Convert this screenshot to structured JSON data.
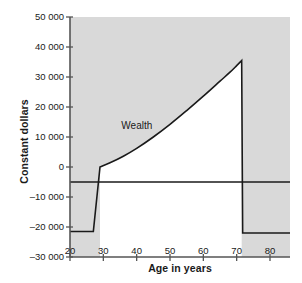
{
  "chart_data": {
    "type": "line",
    "title": "",
    "subtitle": "",
    "xlabel": "Age in years",
    "ylabel": "Constant dollars",
    "xlim": [
      20,
      86
    ],
    "ylim": [
      -30000,
      50000
    ],
    "grid": false,
    "legend_position": "none",
    "plot_background": "#d9d9d9",
    "series_color": "#1a1a1a",
    "xticks": [
      20,
      30,
      40,
      50,
      60,
      70,
      80
    ],
    "xtick_labels": [
      "20",
      "30",
      "40",
      "50",
      "60",
      "70",
      "80"
    ],
    "yticks": [
      50000,
      40000,
      30000,
      20000,
      10000,
      0,
      -10000,
      -20000,
      -30000
    ],
    "ytick_labels": [
      "50 000",
      "40 000",
      "30 000",
      "20 000",
      "10 000",
      "0",
      "–10 000",
      "–20 000",
      "–30 000"
    ],
    "annotations": [
      {
        "text": "Wealth",
        "x": 42,
        "y": 13500
      }
    ],
    "series": [
      {
        "name": "Wealth",
        "type": "line",
        "color": "#1a1a1a",
        "fill_below_to_baseline": "#ffffff",
        "points": [
          {
            "x": 20,
            "y": -21500
          },
          {
            "x": 27,
            "y": -21500
          },
          {
            "x": 29,
            "y": 0
          },
          {
            "x": 32,
            "y": 1400
          },
          {
            "x": 36,
            "y": 3600
          },
          {
            "x": 40,
            "y": 6200
          },
          {
            "x": 45,
            "y": 10000
          },
          {
            "x": 50,
            "y": 14200
          },
          {
            "x": 55,
            "y": 18800
          },
          {
            "x": 60,
            "y": 23600
          },
          {
            "x": 65,
            "y": 28600
          },
          {
            "x": 68,
            "y": 31600
          },
          {
            "x": 70,
            "y": 33800
          },
          {
            "x": 71.5,
            "y": 35500
          },
          {
            "x": 71.8,
            "y": -22000
          },
          {
            "x": 86,
            "y": -22000
          }
        ]
      },
      {
        "name": "Reference line",
        "type": "hline",
        "color": "#1a1a1a",
        "y": -5000,
        "x_from": 20,
        "x_to": 86
      }
    ]
  },
  "figure": {
    "axis_color": "#555555",
    "text_color": "#1a1a1a"
  }
}
